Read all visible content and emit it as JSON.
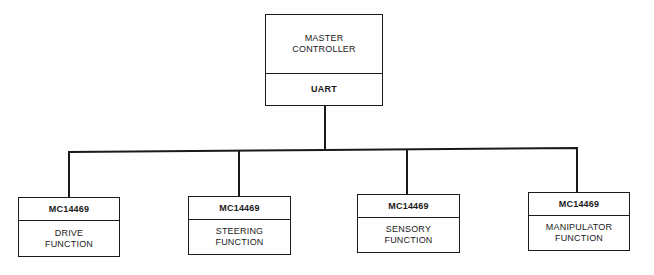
{
  "diagram": {
    "type": "block-diagram",
    "master": {
      "line1": "MASTER",
      "line2": "CONTROLLER",
      "interface": "UART"
    },
    "modules": [
      {
        "chip": "MC14469",
        "line1": "DRIVE",
        "line2": "FUNCTION"
      },
      {
        "chip": "MC14469",
        "line1": "STEERING",
        "line2": "FUNCTION"
      },
      {
        "chip": "MC14469",
        "line1": "SENSORY",
        "line2": "FUNCTION"
      },
      {
        "chip": "MC14469",
        "line1": "MANIPULATOR",
        "line2": "FUNCTION"
      }
    ],
    "colors": {
      "line": "#1a1a1a",
      "background": "#ffffff"
    }
  }
}
